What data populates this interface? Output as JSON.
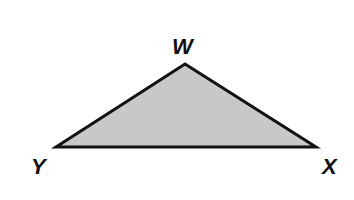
{
  "diagram": {
    "type": "triangle",
    "fill_color": "#c8c8c8",
    "stroke_color": "#111111",
    "stroke_width": 3,
    "vertices": [
      {
        "name": "W",
        "x": 185,
        "y": 64
      },
      {
        "name": "X",
        "x": 316,
        "y": 147
      },
      {
        "name": "Y",
        "x": 56,
        "y": 147
      }
    ],
    "labels": {
      "W": "W",
      "X": "X",
      "Y": "Y"
    }
  }
}
